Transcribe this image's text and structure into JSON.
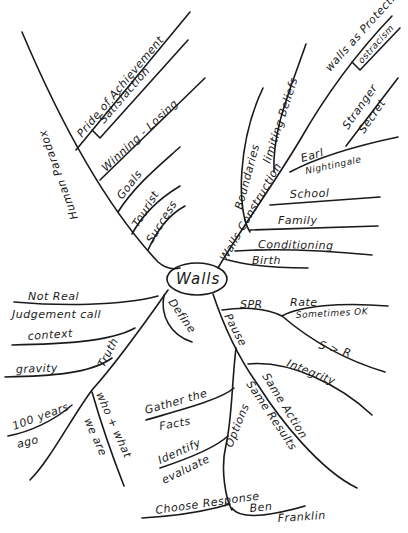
{
  "center": {
    "label": "Walls"
  },
  "branches": {
    "human_paradox": {
      "label": "Human Paradox",
      "children": [
        "Pride of Achievement",
        "Satisfaction",
        "Winning - Losing",
        "Goals",
        "Tourist",
        "Success"
      ]
    },
    "walls_construction": {
      "label": "Walls Construction",
      "children": {
        "boundaries": "Boundaries",
        "limiting_beliefs": "limiting Beliefs",
        "walls_as_protection": "walls as Protection",
        "ostracism": "ostracism",
        "stranger": "Stranger",
        "secret": "Secret",
        "earl": "Earl",
        "nightingale": "Nightingale",
        "school": "School",
        "family": "Family",
        "conditioning": "Conditioning",
        "birth": "Birth"
      }
    },
    "define": {
      "label": "Define"
    },
    "truth": {
      "label": "Truth",
      "children": {
        "not_real": "Not Real",
        "judgement_call": "Judgement call",
        "context": "context",
        "gravity": "gravity",
        "hundred_years": "100 years",
        "ago": "ago",
        "who_what": "who + what",
        "we_are": "we are"
      }
    },
    "pause": {
      "label": "Pause",
      "children": {
        "spr": "SPR",
        "rate": "Rate",
        "sometimes_ok": "Sometimes OK",
        "s_to_r": "S > R",
        "integrity": "Integrity",
        "same_action": "Same Action",
        "same_results": "Same Results",
        "options": "Options",
        "gather_the": "Gather the",
        "facts": "Facts",
        "identify": "Identify",
        "evaluate": "evaluate",
        "choose_response": "Choose Response",
        "ben": "Ben",
        "franklin": "Franklin"
      }
    }
  }
}
